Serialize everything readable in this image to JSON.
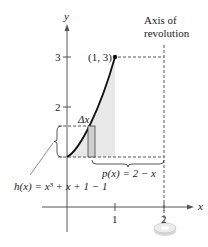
{
  "figure": {
    "axis_label_x": "x",
    "axis_label_y": "y",
    "y_ticks": [
      "2",
      "3"
    ],
    "x_ticks": [
      "1",
      "2"
    ],
    "point_label": "(1, 3)",
    "axis_of_revolution_line1": "Axis of",
    "axis_of_revolution_line2": "revolution",
    "delta_label": "Δx",
    "h_label": "h(x) = x³ + x + 1 − 1",
    "p_label": "p(x) = 2 − x",
    "colors": {
      "curve": "#111111",
      "shade": "#e8e8e8",
      "rect_fill": "#cfcfcf",
      "dashed": "#555555"
    }
  }
}
